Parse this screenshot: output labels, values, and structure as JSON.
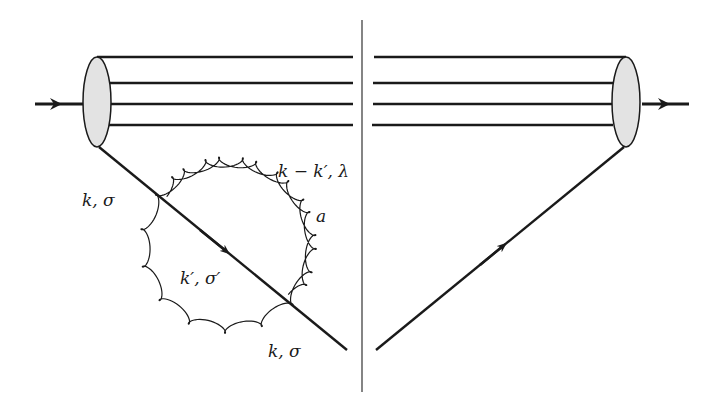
{
  "diagram": {
    "type": "feynman-cut-diagram",
    "colors": {
      "line": "#1a1a1a",
      "blob_fill": "#e3e3e3",
      "background": "#ffffff"
    },
    "labels": {
      "incoming_quark": "k, σ",
      "gluon": "k − k′, λ",
      "gluon_color": "a",
      "internal_quark": "k′, σ′",
      "outgoing_quark": "k, σ"
    },
    "elements": {
      "spectator_lines": 4,
      "blobs": 2,
      "cut_line": "vertical"
    }
  }
}
